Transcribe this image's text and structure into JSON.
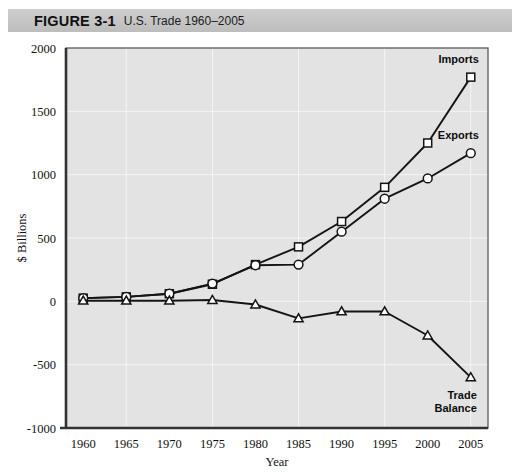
{
  "figure": {
    "label": "FIGURE 3-1",
    "caption": "U.S. Trade 1960–2005"
  },
  "colors": {
    "plot_background": "#e3e3e3",
    "title_bar": "#c6c6c6",
    "grid": "#f4f4f4",
    "line": "#141414",
    "marker_fill": "#ffffff",
    "frame": "#5d5d5d"
  },
  "chart_data": {
    "type": "line",
    "title": "U.S. Trade 1960–2005",
    "xlabel": "Year",
    "ylabel": "$ Billions",
    "x": [
      1960,
      1965,
      1970,
      1975,
      1980,
      1985,
      1990,
      1995,
      2000,
      2005
    ],
    "xticklabels": [
      "1960",
      "1965",
      "1970",
      "1975",
      "1980",
      "1985",
      "1990",
      "1995",
      "2000",
      "2005"
    ],
    "xlim": [
      1958,
      2007
    ],
    "ylim": [
      -1000,
      2000
    ],
    "yticks": [
      2000,
      1500,
      1000,
      500,
      0,
      -500,
      -1000
    ],
    "yticklabels": [
      "2000",
      "1500",
      "1000",
      "500",
      "0",
      "-500",
      "-1000"
    ],
    "grid": true,
    "legend": "inline-right-labels",
    "series": [
      {
        "name": "Imports",
        "marker": "square",
        "label": "Imports",
        "values": [
          25,
          35,
          60,
          135,
          290,
          430,
          630,
          900,
          1250,
          1770
        ]
      },
      {
        "name": "Exports",
        "marker": "circle",
        "label": "Exports",
        "values": [
          25,
          35,
          60,
          140,
          285,
          290,
          550,
          810,
          970,
          1170
        ]
      },
      {
        "name": "Trade Balance",
        "marker": "triangle",
        "label_line1": "Trade",
        "label_line2": "Balance",
        "values": [
          5,
          5,
          5,
          10,
          -25,
          -135,
          -80,
          -80,
          -270,
          -600
        ]
      }
    ]
  }
}
